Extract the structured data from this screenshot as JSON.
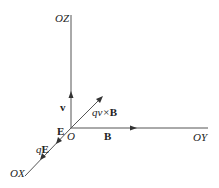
{
  "diagram": {
    "type": "3d-axes-vector-diagram",
    "colors": {
      "line": "#555555",
      "text": "#222222",
      "background": "#ffffff"
    },
    "origin": {
      "label": "O",
      "x": 71,
      "y": 128
    },
    "axes": [
      {
        "id": "z",
        "label": "OZ",
        "from": [
          71,
          128
        ],
        "to": [
          71,
          15
        ]
      },
      {
        "id": "y",
        "label": "OY",
        "from": [
          71,
          128
        ],
        "to": [
          208,
          128
        ]
      },
      {
        "id": "x",
        "label": "OX",
        "from": [
          71,
          128
        ],
        "to": [
          25,
          176
        ]
      }
    ],
    "vectors": [
      {
        "id": "v",
        "label": "v",
        "along": "OZ"
      },
      {
        "id": "B",
        "label": "B",
        "along": "OY"
      },
      {
        "id": "E",
        "label": "E",
        "along": "OX"
      },
      {
        "id": "qE",
        "label_q": "q",
        "label_vec": "E",
        "along": "OX"
      },
      {
        "id": "qvxB",
        "label_q": "qv",
        "label_x": "×",
        "label_vec": "B",
        "direction": "diagonal up-right"
      }
    ]
  }
}
